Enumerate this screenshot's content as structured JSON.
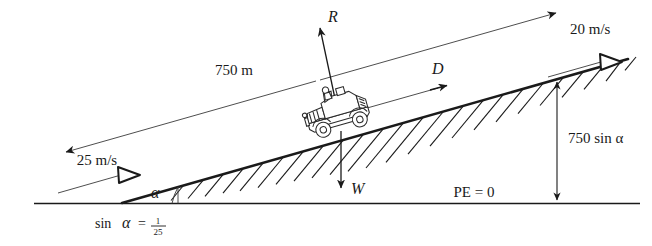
{
  "figure": {
    "type": "physics-free-body-diagram",
    "background_color": "#ffffff",
    "ink_color": "#1a1a1a",
    "width": 652,
    "height": 246
  },
  "labels": {
    "distance_along_incline": "750 m",
    "normal_force": "R",
    "driving_force": "D",
    "weight": "W",
    "velocity_top": "20 m/s",
    "velocity_bottom": "25 m/s",
    "height_rise": "750 sin α",
    "datum": "PE = 0",
    "angle": "α",
    "slope_relation_lhs": "sin",
    "slope_relation_symbol": "α",
    "slope_relation_equals": "=",
    "slope_relation_numerator": "1",
    "slope_relation_denominator": "25"
  },
  "quantities": {
    "incline_length_m": 750,
    "incline_length_unit": "m",
    "speed_top_value": 20,
    "speed_bottom_value": 25,
    "speed_unit": "m/s",
    "sin_alpha_numerator": 1,
    "sin_alpha_denominator": 25,
    "height_expression": "750 sin α",
    "datum_potential_energy": 0
  },
  "vectors": [
    {
      "name": "R",
      "meaning": "normal-reaction-force",
      "direction": "perpendicular-to-incline-upward",
      "head": "solid"
    },
    {
      "name": "D",
      "meaning": "driving-force",
      "direction": "up-the-incline",
      "head": "solid"
    },
    {
      "name": "W",
      "meaning": "weight",
      "direction": "vertically-downward",
      "head": "solid"
    },
    {
      "name": "20 m/s",
      "meaning": "velocity-at-top",
      "direction": "up-the-incline",
      "head": "hollow-triangle"
    },
    {
      "name": "25 m/s",
      "meaning": "velocity-at-bottom",
      "direction": "up-the-incline",
      "head": "hollow-triangle"
    },
    {
      "name": "750 m",
      "meaning": "distance-dimension",
      "direction": "along-incline-both-ways",
      "head": "double-solid"
    },
    {
      "name": "750 sin α",
      "meaning": "height-dimension",
      "direction": "vertical-both-ways",
      "head": "double-solid"
    }
  ]
}
